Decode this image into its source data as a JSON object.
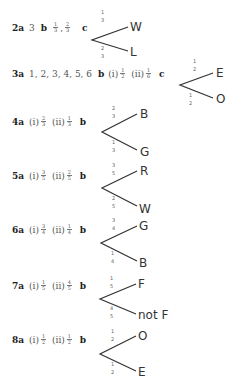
{
  "q2": {
    "label": "2a",
    "a": "3",
    "b_label": "b",
    "b": [
      [
        "1",
        "3"
      ],
      [
        "2",
        "3"
      ]
    ],
    "c_label": "c",
    "tree": {
      "top": {
        "p": [
          "1",
          "3"
        ],
        "outcome": "W"
      },
      "bottom": {
        "p": [
          "2",
          "3"
        ],
        "outcome": "L"
      }
    }
  },
  "q3": {
    "label": "3a",
    "a": "1, 2, 3, 4, 5, 6",
    "b_label": "b",
    "b_i": "(i)",
    "b_i_frac": [
      "1",
      "2"
    ],
    "b_ii": "(ii)",
    "b_ii_frac": [
      "1",
      "6"
    ],
    "c_label": "c",
    "tree": {
      "top": {
        "p": [
          "1",
          "2"
        ],
        "outcome": "E"
      },
      "bottom": {
        "p": [
          "1",
          "2"
        ],
        "outcome": "O"
      }
    }
  },
  "q4": {
    "label": "4a",
    "i": "(i)",
    "i_frac": [
      "2",
      "3"
    ],
    "ii": "(ii)",
    "ii_frac": [
      "1",
      "3"
    ],
    "b_label": "b",
    "tree": {
      "top": {
        "p": [
          "2",
          "3"
        ],
        "outcome": "B"
      },
      "bottom": {
        "p": [
          "1",
          "3"
        ],
        "outcome": "G"
      }
    }
  },
  "q5": {
    "label": "5a",
    "i": "(i)",
    "i_frac": [
      "3",
      "5"
    ],
    "ii": "(ii)",
    "ii_frac": [
      "2",
      "5"
    ],
    "b_label": "b",
    "tree": {
      "top": {
        "p": [
          "3",
          "5"
        ],
        "outcome": "R"
      },
      "bottom": {
        "p": [
          "2",
          "5"
        ],
        "outcome": "W"
      }
    }
  },
  "q6": {
    "label": "6a",
    "i": "(i)",
    "i_frac": [
      "3",
      "4"
    ],
    "ii": "(ii)",
    "ii_frac": [
      "1",
      "4"
    ],
    "b_label": "b",
    "tree": {
      "top": {
        "p": [
          "3",
          "4"
        ],
        "outcome": "G"
      },
      "bottom": {
        "p": [
          "1",
          "4"
        ],
        "outcome": "B"
      }
    }
  },
  "q7": {
    "label": "7a",
    "i": "(i)",
    "i_frac": [
      "1",
      "5"
    ],
    "ii": "(ii)",
    "ii_frac": [
      "4",
      "5"
    ],
    "b_label": "b",
    "tree": {
      "top": {
        "p": [
          "1",
          "5"
        ],
        "outcome": "F"
      },
      "bottom": {
        "p": [
          "4",
          "5"
        ],
        "outcome": "not F"
      }
    }
  },
  "q8": {
    "label": "8a",
    "i": "(i)",
    "i_frac": [
      "1",
      "2"
    ],
    "ii": "(ii)",
    "ii_frac": [
      "1",
      "2"
    ],
    "b_label": "b",
    "tree": {
      "top": {
        "p": [
          "1",
          "2"
        ],
        "outcome": "O"
      },
      "bottom": {
        "p": [
          "1",
          "2"
        ],
        "outcome": "E"
      }
    }
  }
}
